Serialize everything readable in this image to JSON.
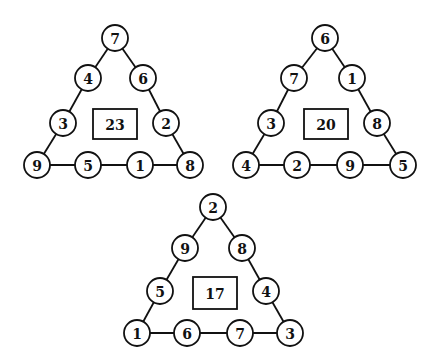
{
  "puzzle": {
    "triangles": [
      {
        "center_value": "23",
        "nodes": [
          "7",
          "4",
          "6",
          "3",
          "2",
          "9",
          "5",
          "1",
          "8"
        ],
        "positions": [
          [
            115,
            38
          ],
          [
            88,
            78
          ],
          [
            143,
            78
          ],
          [
            63,
            123
          ],
          [
            166,
            123
          ],
          [
            37,
            165
          ],
          [
            88,
            165
          ],
          [
            140,
            165
          ],
          [
            190,
            165
          ]
        ],
        "box": [
          93,
          109,
          44,
          30
        ]
      },
      {
        "center_value": "20",
        "nodes": [
          "6",
          "7",
          "1",
          "3",
          "8",
          "4",
          "2",
          "9",
          "5"
        ],
        "positions": [
          [
            325,
            38
          ],
          [
            294,
            78
          ],
          [
            352,
            78
          ],
          [
            271,
            123
          ],
          [
            377,
            123
          ],
          [
            246,
            165
          ],
          [
            297,
            165
          ],
          [
            350,
            165
          ],
          [
            403,
            165
          ]
        ],
        "box": [
          304,
          109,
          44,
          30
        ]
      },
      {
        "center_value": "17",
        "nodes": [
          "2",
          "9",
          "8",
          "5",
          "4",
          "1",
          "6",
          "7",
          "3"
        ],
        "positions": [
          [
            213,
            207
          ],
          [
            185,
            248
          ],
          [
            242,
            248
          ],
          [
            160,
            291
          ],
          [
            266,
            291
          ],
          [
            137,
            333
          ],
          [
            187,
            333
          ],
          [
            240,
            333
          ],
          [
            290,
            333
          ]
        ],
        "box": [
          193,
          277,
          44,
          32
        ]
      }
    ],
    "node_order_legend": [
      "top",
      "left-upper",
      "right-upper",
      "left-lower",
      "right-lower",
      "bottom-left-corner",
      "bottom-mid-left",
      "bottom-mid-right",
      "bottom-right-corner"
    ],
    "colors": {
      "stroke": "#111111",
      "fill": "#ffffff",
      "text": "#111111"
    }
  }
}
